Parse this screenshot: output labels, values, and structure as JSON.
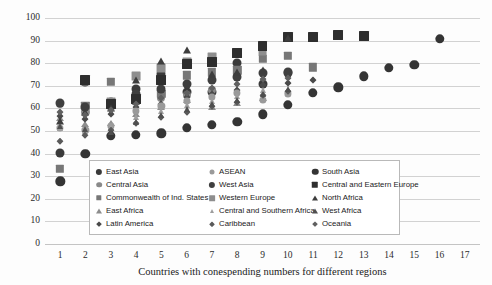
{
  "chart_data": {
    "type": "scatter",
    "title": "",
    "xlabel": "Countries with conespending numbers for different regions",
    "ylabel": "",
    "xlim": [
      0.4,
      17.6
    ],
    "ylim": [
      0,
      100
    ],
    "grid": true,
    "legend_position": "inside-bottom-center",
    "y_ticks": [
      0,
      10,
      20,
      30,
      40,
      50,
      60,
      70,
      80,
      90,
      100
    ],
    "x_ticks": [
      1,
      2,
      3,
      4,
      5,
      6,
      7,
      8,
      9,
      10,
      11,
      12,
      13,
      14,
      15,
      16,
      17
    ],
    "series": [
      {
        "name": "East Asia",
        "marker": "circle",
        "size": 5,
        "color": "#3a3a3a",
        "points": [
          [
            1,
            40.2
          ],
          [
            2,
            71.8
          ],
          [
            3,
            62.4
          ],
          [
            4,
            68.8
          ],
          [
            5,
            75.2
          ],
          [
            6,
            67.2
          ],
          [
            7,
            67.4
          ],
          [
            8,
            80.0
          ],
          [
            9,
            70.6
          ],
          [
            10,
            75.8
          ]
        ]
      },
      {
        "name": "Central Asia",
        "marker": "circle",
        "size": 4.5,
        "color": "#8a8a8a",
        "points": [
          [
            1,
            61.8
          ],
          [
            2,
            58.4
          ],
          [
            3,
            60.6
          ],
          [
            4,
            63.6
          ],
          [
            5,
            64.8
          ],
          [
            6,
            66.0
          ],
          [
            7,
            68.0
          ]
        ]
      },
      {
        "name": "Commonwealth of Ind. States",
        "marker": "square",
        "size": 4.5,
        "color": "#777777",
        "points": [
          [
            1,
            33.2
          ],
          [
            2,
            61.2
          ],
          [
            3,
            71.6
          ],
          [
            4,
            63.2
          ],
          [
            5,
            66.4
          ],
          [
            6,
            74.6
          ],
          [
            7,
            76.0
          ],
          [
            8,
            76.8
          ],
          [
            9,
            82.0
          ],
          [
            10,
            83.2
          ],
          [
            11,
            78.2
          ]
        ]
      },
      {
        "name": "East Africa",
        "marker": "triangle",
        "size": 4,
        "color": "#8d8d8d",
        "points": [
          [
            1,
            55.8
          ],
          [
            2,
            53.2
          ],
          [
            3,
            53.4
          ],
          [
            4,
            57.6
          ],
          [
            5,
            60.8
          ],
          [
            6,
            63.6
          ],
          [
            7,
            60.6
          ],
          [
            8,
            62.6
          ],
          [
            9,
            64.8
          ]
        ]
      },
      {
        "name": "Latin America",
        "marker": "diamond",
        "size": 3.2,
        "color": "#4a4a4a",
        "points": [
          [
            1,
            56.8
          ],
          [
            2,
            55.2
          ],
          [
            3,
            57.4
          ],
          [
            4,
            60.4
          ],
          [
            5,
            62.0
          ],
          [
            6,
            65.2
          ],
          [
            7,
            66.4
          ],
          [
            8,
            68.2
          ],
          [
            9,
            70.4
          ],
          [
            10,
            71.2
          ],
          [
            11,
            72.4
          ]
        ]
      },
      {
        "name": "ASEAN",
        "marker": "circle",
        "size": 4,
        "color": "#9a9a9a",
        "points": [
          [
            1,
            51.4
          ],
          [
            2,
            50.6
          ],
          [
            3,
            52.4
          ],
          [
            4,
            58.8
          ],
          [
            5,
            61.0
          ],
          [
            6,
            63.4
          ],
          [
            7,
            65.0
          ],
          [
            8,
            67.0
          ],
          [
            9,
            63.8
          ],
          [
            10,
            66.6
          ]
        ]
      },
      {
        "name": "West Asia",
        "marker": "circle",
        "size": 5,
        "color": "#3f3f3f",
        "points": [
          [
            1,
            62.6
          ],
          [
            2,
            60.4
          ],
          [
            3,
            63.0
          ],
          [
            4,
            66.2
          ],
          [
            5,
            68.6
          ],
          [
            6,
            71.0
          ],
          [
            7,
            72.4
          ],
          [
            8,
            74.0
          ],
          [
            9,
            75.6
          ],
          [
            10,
            76.2
          ]
        ]
      },
      {
        "name": "Western Europe",
        "marker": "square",
        "size": 4.8,
        "color": "#8e8e8e",
        "points": [
          [
            2,
            72.0
          ],
          [
            3,
            62.8
          ],
          [
            4,
            74.4
          ],
          [
            5,
            78.0
          ],
          [
            6,
            80.4
          ],
          [
            7,
            82.6
          ],
          [
            8,
            84.6
          ],
          [
            9,
            85.2
          ]
        ]
      },
      {
        "name": "Central and Southern Africa",
        "marker": "triangle",
        "size": 3.6,
        "color": "#9e9e9e",
        "points": [
          [
            1,
            51.2
          ],
          [
            2,
            50.2
          ],
          [
            3,
            51.6
          ],
          [
            4,
            56.2
          ],
          [
            5,
            58.8
          ],
          [
            6,
            61.4
          ],
          [
            7,
            63.2
          ],
          [
            8,
            65.4
          ],
          [
            9,
            68.0
          ]
        ]
      },
      {
        "name": "Caribbean",
        "marker": "diamond",
        "size": 3,
        "color": "#5a5a5a",
        "points": [
          [
            1,
            45.4
          ],
          [
            2,
            48.2
          ],
          [
            3,
            50.6
          ],
          [
            4,
            53.4
          ],
          [
            5,
            56.0
          ],
          [
            6,
            58.4
          ],
          [
            7,
            61.2
          ],
          [
            8,
            63.0
          ],
          [
            9,
            65.8
          ],
          [
            10,
            67.6
          ]
        ]
      },
      {
        "name": "South Asia",
        "marker": "circle",
        "size": 5.2,
        "color": "#343434",
        "points": [
          [
            1,
            27.8
          ],
          [
            2,
            40.0
          ],
          [
            3,
            48.0
          ],
          [
            4,
            48.4
          ],
          [
            5,
            49.0
          ],
          [
            6,
            51.4
          ],
          [
            7,
            52.6
          ],
          [
            8,
            54.2
          ],
          [
            9,
            57.4
          ],
          [
            10,
            61.6
          ],
          [
            11,
            66.8
          ],
          [
            12,
            69.4
          ],
          [
            13,
            74.2
          ],
          [
            14,
            78.0
          ],
          [
            15,
            79.2
          ],
          [
            16,
            90.8
          ]
        ]
      },
      {
        "name": "Central and Eastern Europe",
        "marker": "square",
        "size": 5.4,
        "color": "#2e2e2e",
        "points": [
          [
            2,
            72.4
          ],
          [
            3,
            62.0
          ],
          [
            4,
            64.0
          ],
          [
            5,
            72.6
          ],
          [
            6,
            79.8
          ],
          [
            7,
            80.4
          ],
          [
            8,
            84.6
          ],
          [
            9,
            87.4
          ],
          [
            10,
            91.4
          ],
          [
            11,
            91.6
          ],
          [
            12,
            92.4
          ],
          [
            13,
            92.2
          ]
        ]
      },
      {
        "name": "North Africa",
        "marker": "triangle",
        "size": 4.2,
        "color": "#3d3d3d",
        "points": [
          [
            1,
            54.4
          ],
          [
            2,
            58.2
          ],
          [
            3,
            60.2
          ],
          [
            4,
            72.4
          ],
          [
            5,
            81.0
          ],
          [
            6,
            85.8
          ],
          [
            7,
            75.4
          ],
          [
            8,
            76.0
          ],
          [
            9,
            76.8
          ],
          [
            10,
            91.2
          ]
        ]
      },
      {
        "name": "West Africa",
        "marker": "triangle",
        "size": 3.8,
        "color": "#4f4f4f",
        "points": [
          [
            1,
            52.0
          ],
          [
            2,
            51.0
          ],
          [
            3,
            49.6
          ],
          [
            4,
            54.2
          ],
          [
            5,
            57.0
          ],
          [
            6,
            59.6
          ],
          [
            7,
            61.8
          ],
          [
            8,
            63.6
          ],
          [
            9,
            66.2
          ],
          [
            10,
            68.4
          ]
        ]
      },
      {
        "name": "Oceania",
        "marker": "diamond",
        "size": 3.2,
        "color": "#606060",
        "points": [
          [
            1,
            58.6
          ],
          [
            2,
            57.2
          ],
          [
            3,
            59.4
          ],
          [
            4,
            61.8
          ],
          [
            5,
            64.4
          ],
          [
            6,
            67.0
          ],
          [
            7,
            69.2
          ],
          [
            8,
            71.0
          ],
          [
            9,
            72.8
          ],
          [
            10,
            73.6
          ]
        ]
      }
    ]
  },
  "legend": {
    "rows": [
      [
        {
          "label": "East Asia",
          "marker": "circle",
          "color": "#3a3a3a",
          "size": 5
        },
        {
          "label": "ASEAN",
          "marker": "circle",
          "color": "#9a9a9a",
          "size": 4
        },
        {
          "label": "South Asia",
          "marker": "circle",
          "color": "#343434",
          "size": 5.2
        }
      ],
      [
        {
          "label": "Central Asia",
          "marker": "circle",
          "color": "#8a8a8a",
          "size": 4.5
        },
        {
          "label": "West Asia",
          "marker": "circle",
          "color": "#3f3f3f",
          "size": 5
        },
        {
          "label": "Central and Eastern Europe",
          "marker": "square",
          "color": "#2e2e2e",
          "size": 5.4
        }
      ],
      [
        {
          "label": "Commonwealth of Ind. States",
          "marker": "square",
          "color": "#777777",
          "size": 4.5
        },
        {
          "label": "Western Europe",
          "marker": "square",
          "color": "#8e8e8e",
          "size": 4.8
        },
        {
          "label": "North Africa",
          "marker": "triangle",
          "color": "#3d3d3d",
          "size": 4.2
        }
      ],
      [
        {
          "label": "East Africa",
          "marker": "triangle",
          "color": "#8d8d8d",
          "size": 4
        },
        {
          "label": "Central and Southern Africa",
          "marker": "triangle",
          "color": "#9e9e9e",
          "size": 3.6
        },
        {
          "label": "West Africa",
          "marker": "triangle",
          "color": "#4f4f4f",
          "size": 3.8
        }
      ],
      [
        {
          "label": "Latin America",
          "marker": "diamond",
          "color": "#4a4a4a",
          "size": 3.2
        },
        {
          "label": "Caribbean",
          "marker": "diamond",
          "color": "#5a5a5a",
          "size": 3
        },
        {
          "label": "Oceania",
          "marker": "diamond",
          "color": "#606060",
          "size": 3.2
        }
      ]
    ]
  },
  "colors": {
    "gridline": "#d2d2d2",
    "background": "#fdfdfd",
    "text": "#1a1a1a",
    "legend_border": "#b9b9b9"
  }
}
